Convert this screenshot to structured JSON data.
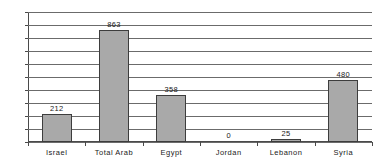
{
  "chart_data": {
    "type": "bar",
    "title": "",
    "subtitle": "",
    "xlabel": "",
    "ylabel": "",
    "categories": [
      "Israel",
      "Total Arab",
      "Egypt",
      "Jordan",
      "Lebanon",
      "Syria"
    ],
    "values": [
      212,
      863,
      358,
      0,
      25,
      480
    ],
    "data_labels": [
      "212",
      "863",
      "358",
      "0",
      "25",
      "480"
    ],
    "ylim": [
      0,
      1000
    ],
    "ytick_step": 100,
    "ytick_labels": [
      "1000",
      "900",
      "800",
      "700",
      "600",
      "500",
      "400",
      "300",
      "200",
      "100",
      "0"
    ],
    "ytick_values": [
      1000,
      900,
      800,
      700,
      600,
      500,
      400,
      300,
      200,
      100,
      0
    ],
    "grid": true,
    "grid_axis": "y",
    "legend": false,
    "legend_position": "none",
    "colors": {
      "bar_fill": "#a9a9a9",
      "bar_border": "#3d3d3d",
      "gridline": "#6b6b6b",
      "axis": "#4a4a4a",
      "text": "#1a1a1a",
      "background": "#ffffff"
    }
  }
}
